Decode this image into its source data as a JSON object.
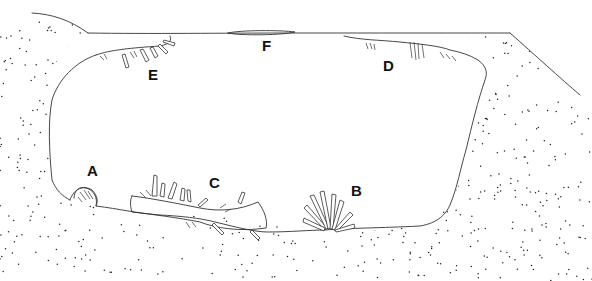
{
  "figure": {
    "labels": [
      {
        "id": "A",
        "text": "A",
        "x": 88,
        "y": 164
      },
      {
        "id": "B",
        "text": "B",
        "x": 351,
        "y": 182
      },
      {
        "id": "C",
        "text": "C",
        "x": 210,
        "y": 176
      },
      {
        "id": "D",
        "text": "D",
        "x": 384,
        "y": 58
      },
      {
        "id": "E",
        "text": "E",
        "x": 149,
        "y": 68
      },
      {
        "id": "F",
        "text": "F",
        "x": 263,
        "y": 40
      }
    ]
  },
  "colors": {
    "line": "#333333",
    "background": "#ffffff",
    "label": "#111111"
  }
}
